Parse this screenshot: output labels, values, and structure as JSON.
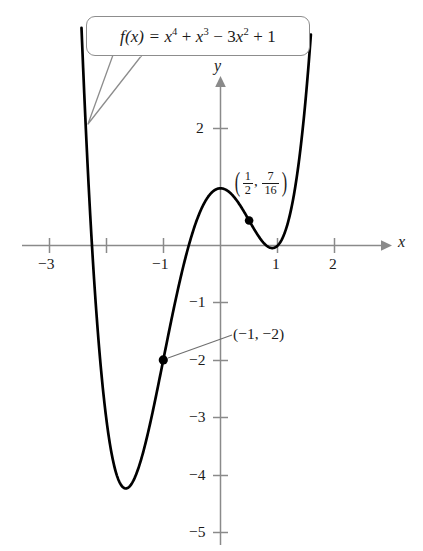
{
  "figure": {
    "title_callout": "f(x) = x^4 + x^3 - 3x^2 + 1",
    "callout_parts": {
      "fx": "f(x) =",
      "t1_base": "x",
      "t1_exp": "4",
      "op1": "+",
      "t2_base": "x",
      "t2_exp": "3",
      "op2": "−",
      "t3_coef": "3",
      "t3_base": "x",
      "t3_exp": "2",
      "op3": "+",
      "t4": "1"
    },
    "axis_x_name": "x",
    "axis_y_name": "y",
    "annotations": [
      {
        "name": "local-max-point-label",
        "text": "(1/2, 7/16)",
        "num1": "1",
        "den1": "2",
        "num2": "7",
        "den2": "16",
        "comma": ",",
        "paren_open": "(",
        "paren_close": ")"
      },
      {
        "name": "inflection-point-label",
        "text": "(−1, −2)"
      }
    ]
  },
  "chart_data": {
    "type": "line",
    "xlabel": "x",
    "ylabel": "y",
    "xlim": [
      -3.5,
      2.9
    ],
    "ylim": [
      -5.4,
      2.7
    ],
    "grid": false,
    "legend": false,
    "x_ticks": [
      -3,
      -2,
      -1,
      1,
      2
    ],
    "x_tick_labels": [
      "−3",
      "",
      "−1",
      "1",
      "2"
    ],
    "y_ticks": [
      2,
      -1,
      -2,
      -3,
      -4,
      -5
    ],
    "y_tick_labels": [
      "2",
      "−1",
      "−2",
      "−3",
      "−4",
      "−5"
    ],
    "function": "x^4 + x^3 - 3x^2 + 1",
    "domain_drawn": [
      -2.43,
      1.58
    ],
    "marked_points": [
      {
        "x": 0.5,
        "y": 0.4375,
        "label": "(1/2, 7/16)"
      },
      {
        "x": -1,
        "y": -2,
        "label": "(−1, −2)"
      }
    ],
    "features": {
      "local_max": {
        "x": 0,
        "y": 1
      },
      "local_min_left": {
        "x": -1.67,
        "y": -4.09
      },
      "local_min_right": {
        "x": 0.9,
        "y": -0.12
      }
    },
    "series": [
      {
        "name": "f(x) = x^4 + x^3 - 3x^2 + 1",
        "x": [
          -2.43,
          -2.3,
          -2.2,
          -2.1,
          -2.0,
          -1.9,
          -1.8,
          -1.7,
          -1.6,
          -1.5,
          -1.4,
          -1.3,
          -1.2,
          -1.1,
          -1.0,
          -0.9,
          -0.8,
          -0.7,
          -0.6,
          -0.5,
          -0.4,
          -0.3,
          -0.2,
          -0.1,
          0.0,
          0.1,
          0.2,
          0.3,
          0.4,
          0.5,
          0.6,
          0.7,
          0.8,
          0.9,
          1.0,
          1.1,
          1.2,
          1.3,
          1.4,
          1.5,
          1.58
        ],
        "y": [
          0.85,
          -1.24,
          -2.12,
          -2.79,
          -3.0,
          -3.61,
          -3.93,
          -4.08,
          -4.07,
          -3.94,
          -3.7,
          -3.39,
          -3.02,
          -2.62,
          -2.0,
          -1.72,
          -1.27,
          -0.82,
          -0.38,
          0.06,
          0.47,
          0.83,
          1.1,
          1.0,
          1.0,
          0.97,
          0.89,
          0.77,
          0.63,
          0.44,
          0.23,
          0.01,
          -0.18,
          -0.31,
          -0.12,
          0.32,
          0.71,
          1.49,
          2.6,
          4.09,
          5.45
        ],
        "color": "#000000",
        "linewidth": 2.6
      }
    ]
  },
  "colors": {
    "curve": "#000000",
    "axis": "#8a8a8a",
    "callout_border": "#8d8d8d",
    "text": "#1a1a1a",
    "point": "#000000"
  }
}
